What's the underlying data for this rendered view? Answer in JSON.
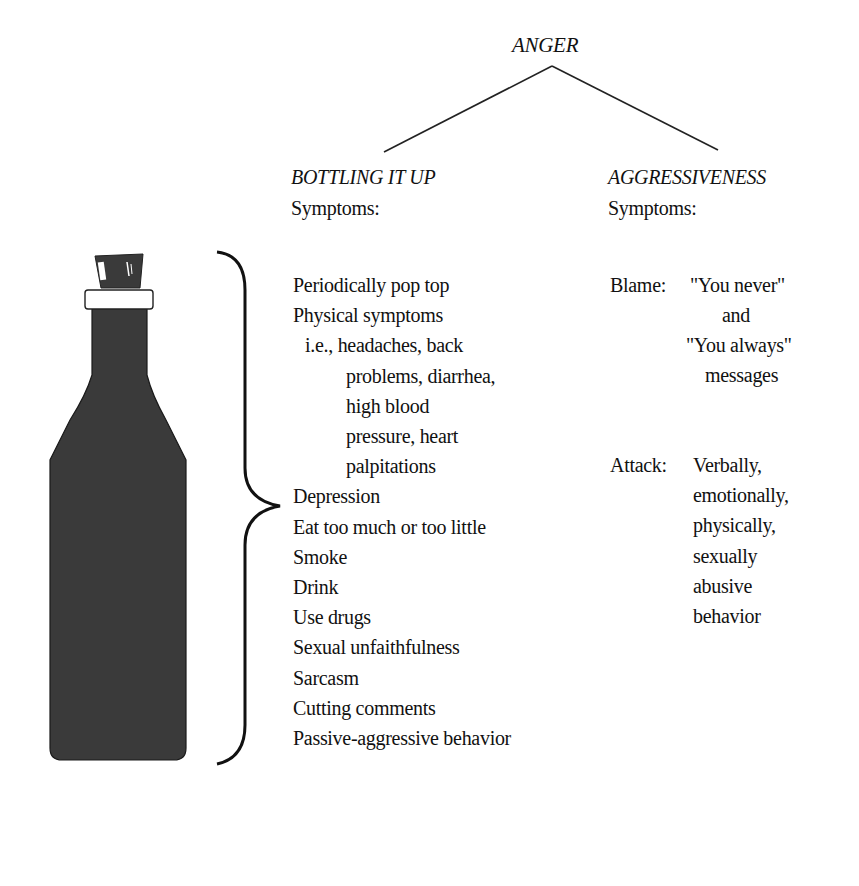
{
  "diagram": {
    "root": "ANGER",
    "branches": [
      {
        "title": "BOTTLING IT UP",
        "subtitle": "Symptoms:",
        "items": [
          "Periodically pop top",
          "Physical symptoms",
          "i.e., headaches, back",
          "problems, diarrhea,",
          "high blood",
          "pressure, heart",
          "palpitations",
          "Depression",
          "Eat too much or too little",
          "Smoke",
          "Drink",
          "Use drugs",
          "Sexual unfaithfulness",
          "Sarcasm",
          "Cutting comments",
          "Passive-aggressive behavior"
        ]
      },
      {
        "title": "AGGRESSIVENESS",
        "subtitle": "Symptoms:",
        "groups": [
          {
            "label": "Blame:",
            "lines": [
              "\"You never\"",
              "and",
              "\"You always\"",
              "messages"
            ]
          },
          {
            "label": "Attack:",
            "lines": [
              "Verbally,",
              "emotionally,",
              "physically,",
              "sexually",
              "abusive",
              "behavior"
            ]
          }
        ]
      }
    ],
    "illustration": "corked-bottle",
    "colors": {
      "bottle": "#3a3a3a",
      "ink": "#111111",
      "background": "#ffffff"
    }
  }
}
